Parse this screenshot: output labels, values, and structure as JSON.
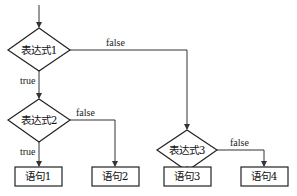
{
  "diagram": {
    "type": "flowchart",
    "decisions": [
      {
        "id": "d1",
        "label": "表达式1"
      },
      {
        "id": "d2",
        "label": "表达式2"
      },
      {
        "id": "d3",
        "label": "表达式3"
      }
    ],
    "statements": [
      {
        "id": "s1",
        "label": "语句1"
      },
      {
        "id": "s2",
        "label": "语句2"
      },
      {
        "id": "s3",
        "label": "语句3"
      },
      {
        "id": "s4",
        "label": "语句4"
      }
    ],
    "edges": [
      {
        "from": "start",
        "to": "d1",
        "label": ""
      },
      {
        "from": "d1",
        "to": "d2",
        "label": "true"
      },
      {
        "from": "d1",
        "to": "d3",
        "label": "false"
      },
      {
        "from": "d2",
        "to": "s1",
        "label": "true"
      },
      {
        "from": "d2",
        "to": "s2",
        "label": "false"
      },
      {
        "from": "d3",
        "to": "s3",
        "label": "true"
      },
      {
        "from": "d3",
        "to": "s4",
        "label": "false"
      }
    ],
    "labels": {
      "true": "true",
      "false": "false"
    }
  }
}
